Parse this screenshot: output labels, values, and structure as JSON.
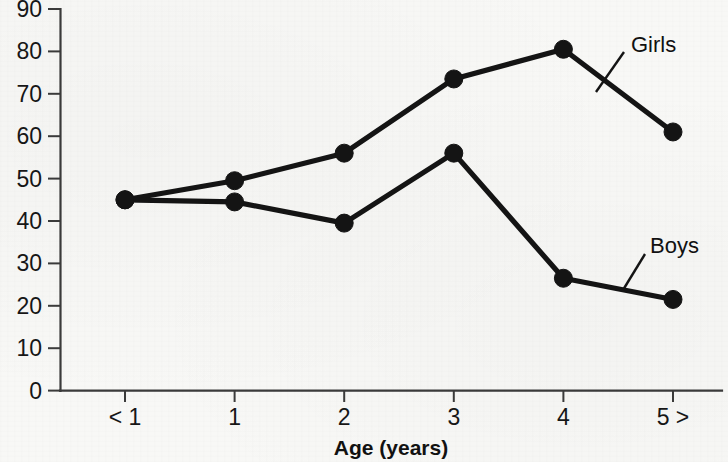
{
  "chart_data": {
    "type": "line",
    "title": "",
    "subtitle": "",
    "xlabel": "Age (years)",
    "ylabel": "",
    "categories": [
      "< 1",
      "1",
      "2",
      "3",
      "4",
      "5 >"
    ],
    "x_tick_labels": [
      "< 1",
      "1",
      "2",
      "3",
      "4",
      "5 >"
    ],
    "y_tick_labels": [
      "0",
      "10",
      "20",
      "30",
      "40",
      "50",
      "60",
      "70",
      "80",
      "90"
    ],
    "y_ticks": [
      0,
      10,
      20,
      30,
      40,
      50,
      60,
      70,
      80,
      90
    ],
    "ylim": [
      0,
      90
    ],
    "grid": false,
    "legend_position": "inline-annotation",
    "marker": "filled-circle",
    "line_color": "#141414",
    "series": [
      {
        "name": "Girls",
        "label": "Girls",
        "values": [
          45,
          49.5,
          56,
          73.5,
          80.5,
          61
        ]
      },
      {
        "name": "Boys",
        "label": "Boys",
        "values": [
          45,
          44.5,
          39.5,
          56,
          26.5,
          21.5
        ]
      }
    ],
    "annotations": [
      {
        "text": "Girls",
        "series": "Girls"
      },
      {
        "text": "Boys",
        "series": "Boys"
      }
    ]
  },
  "axes": {
    "x_axis_title": "Age (years)"
  },
  "colors": {
    "ink": "#141414",
    "axis": "#3b3b3b",
    "paper": "#f8f8f6"
  }
}
